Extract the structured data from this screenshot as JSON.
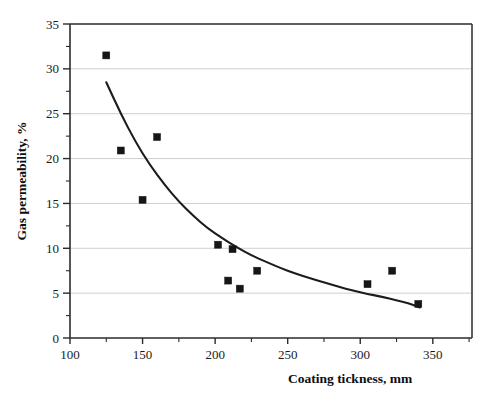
{
  "chart_data": {
    "type": "scatter",
    "title": "",
    "xlabel": "Coating tickness, mm",
    "ylabel": "Gas permeability, %",
    "xlim": [
      100,
      377
    ],
    "ylim": [
      0,
      35
    ],
    "xticks": [
      100,
      150,
      200,
      250,
      300,
      350
    ],
    "yticks": [
      0,
      5,
      10,
      15,
      20,
      25,
      30,
      35
    ],
    "xtick_labels": [
      "100",
      "150",
      "200",
      "250",
      "300",
      "350"
    ],
    "ytick_labels": [
      "0",
      "5",
      "10",
      "15",
      "20",
      "25",
      "30",
      "35"
    ],
    "x_minor_step": 25,
    "y_minor_step": 2.5,
    "grid": "horizontal-major",
    "legend": "none",
    "marker": "filled-square",
    "marker_color": "#161616",
    "curve_color": "#1c1c1c",
    "grid_color": "#b9b9b9",
    "axis_color": "#2b2b2b",
    "points": [
      {
        "x": 125,
        "y": 31.5
      },
      {
        "x": 135,
        "y": 20.9
      },
      {
        "x": 150,
        "y": 15.4
      },
      {
        "x": 160,
        "y": 22.4
      },
      {
        "x": 202,
        "y": 10.4
      },
      {
        "x": 212,
        "y": 9.9
      },
      {
        "x": 209,
        "y": 6.4
      },
      {
        "x": 217,
        "y": 5.5
      },
      {
        "x": 229,
        "y": 7.5
      },
      {
        "x": 305,
        "y": 6.0
      },
      {
        "x": 322,
        "y": 7.5
      },
      {
        "x": 340,
        "y": 3.8
      }
    ],
    "trend_curve": {
      "kind": "exponential-decay-fit",
      "x_start": 125,
      "x_end": 341,
      "points": [
        {
          "x": 125,
          "y": 28.5
        },
        {
          "x": 135,
          "y": 25.0
        },
        {
          "x": 145,
          "y": 21.9
        },
        {
          "x": 155,
          "y": 19.3
        },
        {
          "x": 165,
          "y": 17.1
        },
        {
          "x": 175,
          "y": 15.2
        },
        {
          "x": 185,
          "y": 13.6
        },
        {
          "x": 195,
          "y": 12.2
        },
        {
          "x": 205,
          "y": 11.1
        },
        {
          "x": 215,
          "y": 10.1
        },
        {
          "x": 225,
          "y": 9.2
        },
        {
          "x": 235,
          "y": 8.5
        },
        {
          "x": 245,
          "y": 7.8
        },
        {
          "x": 255,
          "y": 7.2
        },
        {
          "x": 265,
          "y": 6.7
        },
        {
          "x": 275,
          "y": 6.2
        },
        {
          "x": 285,
          "y": 5.7
        },
        {
          "x": 295,
          "y": 5.3
        },
        {
          "x": 305,
          "y": 4.9
        },
        {
          "x": 315,
          "y": 4.6
        },
        {
          "x": 325,
          "y": 4.2
        },
        {
          "x": 333,
          "y": 3.9
        },
        {
          "x": 341,
          "y": 3.4
        }
      ]
    }
  }
}
